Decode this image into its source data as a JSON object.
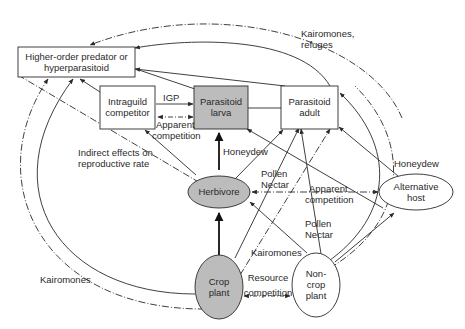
{
  "colors": {
    "stroke": "#2a2a2a",
    "shaded_fill": "#bcbcbc",
    "node_fill": "#ffffff"
  },
  "nodes": {
    "higher_order": {
      "line1": "Higher-order predator or",
      "line2": "hyperparasitoid",
      "shape": "rectangle",
      "shaded": false
    },
    "intraguild": {
      "line1": "Intraguild",
      "line2": "competitor",
      "shape": "rectangle",
      "shaded": false
    },
    "parasitoid_larva": {
      "line1": "Parasitoid",
      "line2": "larva",
      "shape": "rectangle",
      "shaded": true
    },
    "parasitoid_adult": {
      "line1": "Parasitoid",
      "line2": "adult",
      "shape": "rectangle",
      "shaded": false
    },
    "herbivore": {
      "line1": "Herbivore",
      "shape": "ellipse",
      "shaded": true
    },
    "alternative_host": {
      "line1": "Alternative",
      "line2": "host",
      "shape": "ellipse",
      "shaded": false
    },
    "crop_plant": {
      "line1": "Crop",
      "line2": "plant",
      "shape": "ellipse",
      "shaded": true
    },
    "noncrop_plant": {
      "line1": "Non-",
      "line2": "crop",
      "line3": "plant",
      "shape": "ellipse",
      "shaded": false
    }
  },
  "edge_labels": {
    "igp": "IGP",
    "apparent_competition_1": {
      "line1": "Apparent",
      "line2": "competition"
    },
    "indirect_effects": {
      "line1": "Indirect effects on",
      "line2": "reproductive rate"
    },
    "honeydew_1": "Honeydew",
    "honeydew_2": "Honeydew",
    "pollen_nectar_1": {
      "line1": "Pollen",
      "line2": "Nectar"
    },
    "pollen_nectar_2": {
      "line1": "Pollen",
      "line2": "Nectar"
    },
    "apparent_competition_2": {
      "line1": "Apparent",
      "line2": "competition"
    },
    "kairomones_refuges": {
      "line1": "Kairomones,",
      "line2": "refuges"
    },
    "kairomones_left": "Kairomones",
    "kairomones_bottom": "Kairomones",
    "resource_competition": {
      "line1": "Resource",
      "line2": "competition"
    }
  }
}
